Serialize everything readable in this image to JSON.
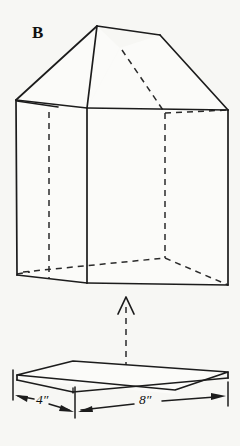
{
  "figure": {
    "label": "B",
    "background_color": "#f7f7f4",
    "line_color": "#1c1c1c"
  },
  "dimensions": {
    "depth_label": "4″",
    "width_label": "8″"
  },
  "icons": {
    "up_arrow": "arrow-up-icon",
    "left_arrow": "arrow-left-icon",
    "right_arrow": "arrow-right-icon"
  }
}
